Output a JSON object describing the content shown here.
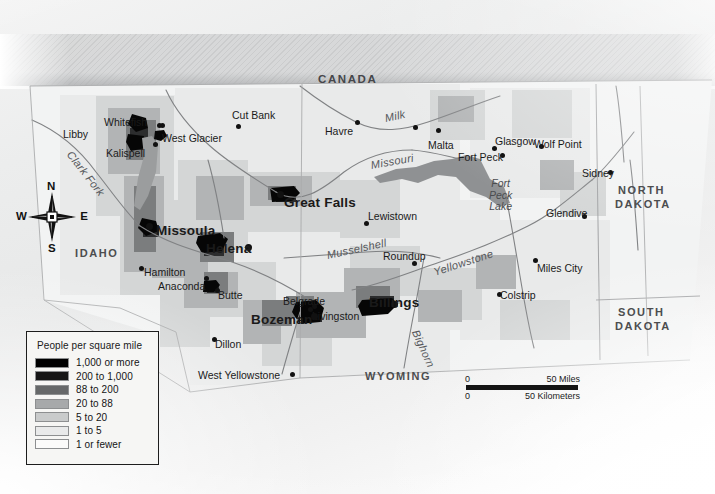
{
  "map": {
    "title": "Montana Population Density",
    "country_label": "CANADA",
    "states": [
      {
        "name": "IDAHO",
        "x": 75,
        "y": 248
      },
      {
        "name": "NORTH",
        "x": 618,
        "y": 185
      },
      {
        "name": "DAKOTA",
        "x": 615,
        "y": 199
      },
      {
        "name": "SOUTH",
        "x": 618,
        "y": 307
      },
      {
        "name": "DAKOTA",
        "x": 615,
        "y": 321
      },
      {
        "name": "WYOMING",
        "x": 365,
        "y": 371
      }
    ],
    "cities": [
      {
        "name": "Libby",
        "x": 63,
        "y": 129,
        "dx": 413,
        "dy": 125,
        "major": false
      },
      {
        "name": "Whitefish",
        "x": 104,
        "y": 117,
        "dx": 160,
        "dy": 123,
        "major": false
      },
      {
        "name": "West Glacier",
        "x": 162,
        "y": 133,
        "dx": 157,
        "dy": 123,
        "major": false
      },
      {
        "name": "Kalispell",
        "x": 106,
        "y": 148,
        "dx": 153,
        "dy": 142,
        "major": false
      },
      {
        "name": "Cut Bank",
        "x": 232,
        "y": 110,
        "dx": 236,
        "dy": 124,
        "major": false
      },
      {
        "name": "Havre",
        "x": 325,
        "y": 126,
        "dx": 355,
        "dy": 120,
        "major": false
      },
      {
        "name": "Malta",
        "x": 428,
        "y": 140,
        "dx": 436,
        "dy": 128,
        "major": false
      },
      {
        "name": "Glasgow",
        "x": 495,
        "y": 136,
        "dx": 492,
        "dy": 146,
        "major": false
      },
      {
        "name": "Wolf Point",
        "x": 534,
        "y": 139,
        "dx": 539,
        "dy": 144,
        "major": false
      },
      {
        "name": "Fort Peck",
        "x": 458,
        "y": 152,
        "dx": 500,
        "dy": 153,
        "major": false
      },
      {
        "name": "Sidney",
        "x": 582,
        "y": 168,
        "dx": 608,
        "dy": 170,
        "major": false
      },
      {
        "name": "Glendive",
        "x": 546,
        "y": 208,
        "dx": 582,
        "dy": 214,
        "major": false
      },
      {
        "name": "Lewistown",
        "x": 368,
        "y": 211,
        "dx": 364,
        "dy": 221,
        "major": false
      },
      {
        "name": "Roundup",
        "x": 383,
        "y": 251,
        "dx": 412,
        "dy": 261,
        "major": false
      },
      {
        "name": "Miles City",
        "x": 537,
        "y": 263,
        "dx": 533,
        "dy": 258,
        "major": false
      },
      {
        "name": "Colstrip",
        "x": 500,
        "y": 290,
        "dx": 497,
        "dy": 292,
        "major": false
      },
      {
        "name": "Hamilton",
        "x": 144,
        "y": 267,
        "dx": 139,
        "dy": 266,
        "major": false
      },
      {
        "name": "Anaconda",
        "x": 158,
        "y": 281,
        "dx": 204,
        "dy": 276,
        "major": false
      },
      {
        "name": "Butte",
        "x": 218,
        "y": 290,
        "dx": 215,
        "dy": 288,
        "major": false
      },
      {
        "name": "Belgrade",
        "x": 283,
        "y": 296,
        "dx": 312,
        "dy": 304,
        "major": false
      },
      {
        "name": "Livingston",
        "x": 312,
        "y": 311,
        "dx": 308,
        "dy": 307,
        "major": false
      },
      {
        "name": "Dillon",
        "x": 215,
        "y": 339,
        "dx": 212,
        "dy": 337,
        "major": false
      },
      {
        "name": "West Yellowstone",
        "x": 198,
        "y": 370,
        "dx": 290,
        "dy": 372,
        "major": false
      },
      {
        "name": "Missoula",
        "x": 156,
        "y": 224,
        "dx": 146,
        "dy": 223,
        "major": true
      },
      {
        "name": "Helena",
        "x": 206,
        "y": 242,
        "dx": 245,
        "dy": 244,
        "major": true
      },
      {
        "name": "Great Falls",
        "x": 284,
        "y": 196,
        "dx": 277,
        "dy": 191,
        "major": true
      },
      {
        "name": "Bozeman",
        "x": 251,
        "y": 313,
        "dx": 311,
        "dy": 313,
        "major": true
      },
      {
        "name": "Billings",
        "x": 369,
        "y": 296,
        "dx": 391,
        "dy": 301,
        "major": true
      }
    ],
    "rivers": [
      {
        "name": "Clark Fork",
        "x": 69,
        "y": 147,
        "rotate": 52
      },
      {
        "name": "Milk",
        "x": 385,
        "y": 113,
        "rotate": -12
      },
      {
        "name": "Missouri",
        "x": 371,
        "y": 160,
        "rotate": -10
      },
      {
        "name": "Musselshell",
        "x": 327,
        "y": 250,
        "rotate": -12
      },
      {
        "name": "Yellowstone",
        "x": 434,
        "y": 267,
        "rotate": -18
      },
      {
        "name": "Bighorn",
        "x": 415,
        "y": 325,
        "rotate": 66
      }
    ],
    "lakes": [
      {
        "lines": [
          "Fort",
          "Peck",
          "Lake"
        ],
        "x": 489,
        "y": 178
      }
    ],
    "compass": {
      "n": "N",
      "s": "S",
      "e": "E",
      "w": "W"
    }
  },
  "legend": {
    "title": "People per square mile",
    "rows": [
      {
        "label": "1,000 or more",
        "color": "#000000"
      },
      {
        "label": "200 to 1,000",
        "color": "#161616"
      },
      {
        "label": "88 to 200",
        "color": "#666869"
      },
      {
        "label": "20 to 88",
        "color": "#a7a9aa"
      },
      {
        "label": "5 to 20",
        "color": "#c9cbcb"
      },
      {
        "label": "1 to 5",
        "color": "#e9eaea"
      },
      {
        "label": "1 or fewer",
        "color": "#fbfbfa"
      }
    ]
  },
  "scale": {
    "miles_zero": "0",
    "miles_label": "50 Miles",
    "km_zero": "0",
    "km_label": "50 Kilometers"
  }
}
